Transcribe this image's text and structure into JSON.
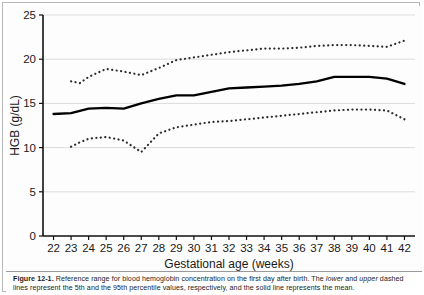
{
  "figure": {
    "label": "Figure 12-1.",
    "caption_line1": "Reference range for blood hemoglobin concentration on the first day after birth. The",
    "caption_em1": "lower",
    "caption_mid1": "and",
    "caption_em2": "upper",
    "caption_line2": "dashed lines represent the 5th and the 95th percentile values, respectively, and the solid line represents the mean."
  },
  "chart_data": {
    "type": "line",
    "title": "",
    "xlabel": "Gestational age (weeks)",
    "ylabel": "HGB (g/dL)",
    "xlim": [
      21.4,
      42.6
    ],
    "ylim": [
      0,
      25
    ],
    "xticks": [
      22,
      23,
      24,
      25,
      26,
      27,
      28,
      29,
      30,
      31,
      32,
      33,
      34,
      35,
      36,
      37,
      38,
      39,
      40,
      41,
      42
    ],
    "yticks": [
      0,
      5,
      10,
      15,
      20,
      25
    ],
    "grid": true,
    "grid_axis": "y",
    "legend": "none",
    "x": [
      22,
      23,
      24,
      25,
      26,
      27,
      28,
      29,
      30,
      31,
      32,
      33,
      34,
      35,
      36,
      37,
      38,
      39,
      40,
      41,
      42
    ],
    "series": [
      {
        "name": "95th percentile",
        "style": "dashed",
        "color": "#2b2b2b",
        "x": [
          23,
          23.5,
          24,
          25,
          26,
          27,
          28,
          29,
          30,
          31,
          32,
          33,
          34,
          35,
          36,
          37,
          38,
          39,
          40,
          41,
          42
        ],
        "values": [
          17.5,
          17.3,
          18.0,
          18.9,
          18.6,
          18.2,
          19.0,
          19.9,
          20.2,
          20.5,
          20.8,
          21.0,
          21.2,
          21.2,
          21.3,
          21.5,
          21.6,
          21.6,
          21.5,
          21.4,
          22.1
        ]
      },
      {
        "name": "Mean",
        "style": "solid",
        "color": "#000000",
        "x": [
          22,
          23,
          24,
          25,
          26,
          27,
          28,
          29,
          30,
          31,
          32,
          33,
          34,
          35,
          36,
          37,
          38,
          39,
          40,
          41,
          42
        ],
        "values": [
          13.8,
          13.9,
          14.4,
          14.5,
          14.4,
          15.0,
          15.5,
          15.9,
          15.9,
          16.3,
          16.7,
          16.8,
          16.9,
          17.0,
          17.2,
          17.5,
          18.0,
          18.0,
          18.0,
          17.8,
          17.2
        ]
      },
      {
        "name": "5th percentile",
        "style": "dashed",
        "color": "#2b2b2b",
        "x": [
          23,
          23.5,
          24,
          25,
          26,
          27,
          28,
          29,
          30,
          31,
          32,
          33,
          34,
          35,
          36,
          37,
          38,
          39,
          40,
          41,
          42
        ],
        "values": [
          10.1,
          10.6,
          11.0,
          11.2,
          10.8,
          9.5,
          11.6,
          12.3,
          12.6,
          12.9,
          13.0,
          13.2,
          13.4,
          13.6,
          13.8,
          14.0,
          14.2,
          14.3,
          14.3,
          14.2,
          13.2
        ]
      }
    ]
  }
}
